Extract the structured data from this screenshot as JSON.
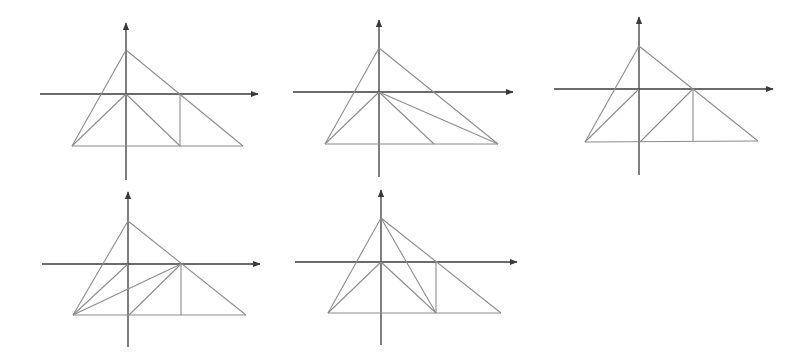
{
  "colors": {
    "background": "#ffffff",
    "axis": "#3a3a3a",
    "line": "#8c8c8c"
  },
  "figures": [
    {
      "id": "fig-1",
      "axes": {
        "x": [
          40,
          258,
          94
        ],
        "y": [
          126,
          23,
          180
        ]
      },
      "points": {
        "A": [
          126,
          50
        ],
        "O": [
          126,
          94
        ],
        "B": [
          72,
          146
        ],
        "C": [
          243,
          146
        ],
        "E": [
          180,
          94
        ],
        "F": [
          180,
          146
        ]
      },
      "segments": [
        [
          "A",
          "B"
        ],
        [
          "A",
          "C"
        ],
        [
          "B",
          "C"
        ],
        [
          "O",
          "B"
        ],
        [
          "O",
          "F"
        ],
        [
          "E",
          "F"
        ]
      ]
    },
    {
      "id": "fig-2",
      "axes": {
        "x": [
          293,
          513,
          92
        ],
        "y": [
          379,
          20,
          177
        ]
      },
      "points": {
        "A": [
          379,
          48
        ],
        "O": [
          379,
          92
        ],
        "B": [
          325,
          144
        ],
        "C": [
          498,
          144
        ],
        "D": [
          434,
          144
        ]
      },
      "segments": [
        [
          "A",
          "B"
        ],
        [
          "A",
          "C"
        ],
        [
          "B",
          "C"
        ],
        [
          "O",
          "B"
        ],
        [
          "O",
          "D"
        ],
        [
          "O",
          "C"
        ]
      ]
    },
    {
      "id": "fig-3",
      "axes": {
        "x": [
          554,
          773,
          89
        ],
        "y": [
          639,
          17,
          175
        ]
      },
      "points": {
        "A": [
          639,
          46
        ],
        "O": [
          639,
          89
        ],
        "B": [
          585,
          142
        ],
        "C": [
          758,
          141
        ],
        "E": [
          693,
          89
        ],
        "F": [
          693,
          141
        ],
        "G": [
          640,
          142
        ]
      },
      "segments": [
        [
          "A",
          "B"
        ],
        [
          "A",
          "C"
        ],
        [
          "B",
          "C"
        ],
        [
          "O",
          "B"
        ],
        [
          "E",
          "G"
        ],
        [
          "E",
          "F"
        ]
      ]
    },
    {
      "id": "fig-4",
      "axes": {
        "x": [
          42,
          260,
          264
        ],
        "y": [
          128,
          192,
          347
        ]
      },
      "points": {
        "A": [
          128,
          221
        ],
        "O": [
          128,
          264
        ],
        "B": [
          73,
          315
        ],
        "C": [
          246,
          315
        ],
        "E": [
          181,
          264
        ],
        "F": [
          181,
          315
        ],
        "G": [
          129,
          315
        ]
      },
      "segments": [
        [
          "A",
          "B"
        ],
        [
          "A",
          "C"
        ],
        [
          "B",
          "C"
        ],
        [
          "O",
          "B"
        ],
        [
          "E",
          "B"
        ],
        [
          "E",
          "G"
        ],
        [
          "E",
          "F"
        ]
      ]
    },
    {
      "id": "fig-5",
      "axes": {
        "x": [
          295,
          517,
          262
        ],
        "y": [
          381,
          190,
          345
        ]
      },
      "points": {
        "A": [
          381,
          218
        ],
        "O": [
          381,
          262
        ],
        "B": [
          328,
          313
        ],
        "C": [
          501,
          313
        ],
        "E": [
          436,
          262
        ],
        "F": [
          436,
          313
        ]
      },
      "segments": [
        [
          "A",
          "B"
        ],
        [
          "A",
          "C"
        ],
        [
          "B",
          "C"
        ],
        [
          "O",
          "B"
        ],
        [
          "O",
          "F"
        ],
        [
          "A",
          "F"
        ],
        [
          "E",
          "F"
        ]
      ]
    }
  ]
}
